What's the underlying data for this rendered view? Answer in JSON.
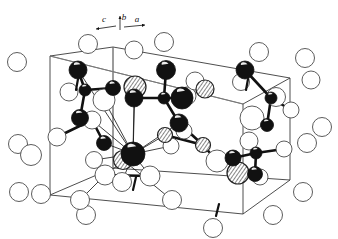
{
  "figure": {
    "kind": "crystal-structure-unit-cell-diagram",
    "title": "",
    "caption": "",
    "background_color": "#ffffff",
    "ink_color": "#111111"
  },
  "axis_indicator": {
    "name": "crystallographic-axes",
    "labels": [
      {
        "id": "c",
        "text": "c",
        "x": 104,
        "y": 22,
        "arrow_from": [
          116,
          26
        ],
        "arrow_to": [
          96,
          29
        ]
      },
      {
        "id": "b",
        "text": "b",
        "x": 124,
        "y": 20,
        "arrow_from": [
          120,
          30
        ],
        "arrow_to": [
          120,
          16
        ]
      },
      {
        "id": "a",
        "text": "a",
        "x": 137,
        "y": 22,
        "arrow_from": [
          124,
          27
        ],
        "arrow_to": [
          145,
          25
        ]
      }
    ],
    "origin": [
      120,
      29
    ]
  },
  "unit_cell_box": {
    "name": "unit-cell-outline",
    "stroke": "#3a3a3a",
    "stroke_width": 0.9,
    "vertices": {
      "front_bottom_left": [
        50,
        195
      ],
      "front_bottom_right": [
        243,
        214
      ],
      "front_top_right": [
        243,
        104
      ],
      "front_top_left": [
        50,
        56
      ],
      "back_bottom_left": [
        113,
        168
      ],
      "back_bottom_right": [
        290,
        180
      ],
      "back_top_right": [
        290,
        78
      ],
      "back_top_left": [
        113,
        47
      ]
    },
    "internal_guides": [
      {
        "from": [
          113,
          47
        ],
        "to": [
          113,
          168
        ]
      },
      {
        "from": [
          50,
          56
        ],
        "to": [
          243,
          104
        ]
      }
    ]
  },
  "legend_note": {
    "dark_sphere_label": "dark atom",
    "open_sphere_label": "open atom",
    "half_shaded_label": "shaded atom"
  },
  "chart_data": {
    "type": "scatter",
    "title": "",
    "xlabel": "",
    "ylabel": "",
    "note": "3D unit-cell packing diagram; spheres are atom positions projected to 2D, lines are bonds and cell edges.",
    "atom_styles": {
      "dark": {
        "fill": "#111111",
        "stroke": "#111111"
      },
      "open": {
        "fill": "#ffffff",
        "stroke": "#4a4a4a"
      },
      "shaded": {
        "fill": "#ffffff",
        "stroke": "#222222",
        "hatch": true
      }
    },
    "atoms": [
      {
        "id": "o1",
        "style": "open",
        "cx": 17,
        "cy": 62,
        "r": 9.5
      },
      {
        "id": "o2",
        "style": "open",
        "cx": 18,
        "cy": 144,
        "r": 9.5
      },
      {
        "id": "o3",
        "style": "open",
        "cx": 31,
        "cy": 155,
        "r": 10.5
      },
      {
        "id": "o4",
        "style": "open",
        "cx": 19,
        "cy": 192,
        "r": 9.5
      },
      {
        "id": "o5",
        "style": "open",
        "cx": 88,
        "cy": 44,
        "r": 9.5
      },
      {
        "id": "o6",
        "style": "open",
        "cx": 134,
        "cy": 50,
        "r": 9
      },
      {
        "id": "o7",
        "style": "open",
        "cx": 164,
        "cy": 42,
        "r": 9.5
      },
      {
        "id": "o8",
        "style": "open",
        "cx": 259,
        "cy": 52,
        "r": 9.5
      },
      {
        "id": "o9",
        "style": "open",
        "cx": 305,
        "cy": 58,
        "r": 9.5
      },
      {
        "id": "o10",
        "style": "open",
        "cx": 311,
        "cy": 80,
        "r": 9
      },
      {
        "id": "o11",
        "style": "open",
        "cx": 307,
        "cy": 143,
        "r": 9.5
      },
      {
        "id": "o12",
        "style": "open",
        "cx": 303,
        "cy": 192,
        "r": 9.5
      },
      {
        "id": "o13",
        "style": "open",
        "cx": 322,
        "cy": 127,
        "r": 9.5
      },
      {
        "id": "o14",
        "style": "open",
        "cx": 86,
        "cy": 215,
        "r": 9.5
      },
      {
        "id": "o15",
        "style": "open",
        "cx": 213,
        "cy": 228,
        "r": 9.5
      },
      {
        "id": "o16",
        "style": "open",
        "cx": 273,
        "cy": 215,
        "r": 9.5
      },
      {
        "id": "o17",
        "style": "open",
        "cx": 57,
        "cy": 137,
        "r": 9
      },
      {
        "id": "o18",
        "style": "open",
        "cx": 104,
        "cy": 100,
        "r": 11
      },
      {
        "id": "o19",
        "style": "open",
        "cx": 69,
        "cy": 92,
        "r": 9
      },
      {
        "id": "o20",
        "style": "open",
        "cx": 92,
        "cy": 120,
        "r": 9
      },
      {
        "id": "o21",
        "style": "open",
        "cx": 94,
        "cy": 160,
        "r": 8.5
      },
      {
        "id": "o22",
        "style": "open",
        "cx": 105,
        "cy": 175,
        "r": 10
      },
      {
        "id": "o23",
        "style": "open",
        "cx": 122,
        "cy": 182,
        "r": 9.5
      },
      {
        "id": "o24",
        "style": "open",
        "cx": 150,
        "cy": 176,
        "r": 10
      },
      {
        "id": "o25",
        "style": "open",
        "cx": 41,
        "cy": 194,
        "r": 9.5
      },
      {
        "id": "o26",
        "style": "open",
        "cx": 80,
        "cy": 200,
        "r": 9.5
      },
      {
        "id": "o27",
        "style": "open",
        "cx": 172,
        "cy": 200,
        "r": 9.5
      },
      {
        "id": "o28",
        "style": "open",
        "cx": 171,
        "cy": 146,
        "r": 8
      },
      {
        "id": "o29",
        "style": "open",
        "cx": 184,
        "cy": 131,
        "r": 8
      },
      {
        "id": "o30",
        "style": "open",
        "cx": 217,
        "cy": 161,
        "r": 11
      },
      {
        "id": "o31",
        "style": "open",
        "cx": 187,
        "cy": 96,
        "r": 9
      },
      {
        "id": "o32",
        "style": "open",
        "cx": 252,
        "cy": 118,
        "r": 12
      },
      {
        "id": "o33",
        "style": "open",
        "cx": 276,
        "cy": 97,
        "r": 9.5
      },
      {
        "id": "o34",
        "style": "open",
        "cx": 291,
        "cy": 110,
        "r": 8
      },
      {
        "id": "o35",
        "style": "open",
        "cx": 249,
        "cy": 141,
        "r": 9
      },
      {
        "id": "o36",
        "style": "open",
        "cx": 241,
        "cy": 82,
        "r": 8.5
      },
      {
        "id": "o37",
        "style": "open",
        "cx": 284,
        "cy": 149,
        "r": 8
      },
      {
        "id": "o38",
        "style": "open",
        "cx": 260,
        "cy": 177,
        "r": 8
      },
      {
        "id": "o39",
        "style": "open",
        "cx": 195,
        "cy": 81,
        "r": 9
      },
      {
        "id": "sh1",
        "style": "shaded",
        "cx": 135,
        "cy": 87,
        "r": 11
      },
      {
        "id": "sh2",
        "style": "shaded",
        "cx": 205,
        "cy": 89,
        "r": 9
      },
      {
        "id": "sh3",
        "style": "shaded",
        "cx": 165,
        "cy": 135,
        "r": 7.5
      },
      {
        "id": "sh4",
        "style": "shaded",
        "cx": 123,
        "cy": 160,
        "r": 9.5
      },
      {
        "id": "sh5",
        "style": "shaded",
        "cx": 203,
        "cy": 145,
        "r": 7.5
      },
      {
        "id": "sh6",
        "style": "shaded",
        "cx": 238,
        "cy": 173,
        "r": 11
      },
      {
        "id": "d1",
        "style": "dark",
        "cx": 78,
        "cy": 70,
        "r": 9
      },
      {
        "id": "d2",
        "style": "dark",
        "cx": 85,
        "cy": 90,
        "r": 6
      },
      {
        "id": "d3",
        "style": "dark",
        "cx": 113,
        "cy": 88,
        "r": 7.5
      },
      {
        "id": "d4",
        "style": "dark",
        "cx": 80,
        "cy": 118,
        "r": 8.5
      },
      {
        "id": "d5",
        "style": "dark",
        "cx": 134,
        "cy": 98,
        "r": 9
      },
      {
        "id": "d6",
        "style": "dark",
        "cx": 166,
        "cy": 70,
        "r": 9.5
      },
      {
        "id": "d7",
        "style": "dark",
        "cx": 164,
        "cy": 98,
        "r": 6
      },
      {
        "id": "d8",
        "style": "dark",
        "cx": 182,
        "cy": 98,
        "r": 11
      },
      {
        "id": "d9",
        "style": "dark",
        "cx": 179,
        "cy": 123,
        "r": 9
      },
      {
        "id": "d10",
        "style": "dark",
        "cx": 133,
        "cy": 154,
        "r": 12
      },
      {
        "id": "d11",
        "style": "dark",
        "cx": 245,
        "cy": 70,
        "r": 9
      },
      {
        "id": "d12",
        "style": "dark",
        "cx": 104,
        "cy": 143,
        "r": 7.5
      },
      {
        "id": "d13",
        "style": "dark",
        "cx": 233,
        "cy": 158,
        "r": 8
      },
      {
        "id": "d14",
        "style": "dark",
        "cx": 256,
        "cy": 153,
        "r": 6
      },
      {
        "id": "d15",
        "style": "dark",
        "cx": 255,
        "cy": 174,
        "r": 7.5
      },
      {
        "id": "d16",
        "style": "dark",
        "cx": 271,
        "cy": 98,
        "r": 6
      },
      {
        "id": "d17",
        "style": "dark",
        "cx": 267,
        "cy": 125,
        "r": 6.5
      }
    ],
    "bonds_solid": [
      {
        "from": "d1",
        "to": "d2"
      },
      {
        "from": "d2",
        "to": "d3"
      },
      {
        "from": "d2",
        "to": "d4"
      },
      {
        "from": "d6",
        "to": "d7"
      },
      {
        "from": "d7",
        "to": "d8"
      },
      {
        "from": "d7",
        "to": "d5"
      },
      {
        "from": "d7",
        "to": "d9"
      },
      {
        "from": "d9",
        "to": "sh5"
      },
      {
        "from": "sh5",
        "to": "sh3"
      },
      {
        "from": "sh5",
        "to": "o30"
      },
      {
        "from": "d11",
        "to": "d16"
      },
      {
        "from": "d16",
        "to": "o34"
      },
      {
        "from": "d16",
        "to": "o33"
      },
      {
        "from": "d16",
        "to": "d17"
      },
      {
        "from": "d13",
        "to": "d14"
      },
      {
        "from": "d14",
        "to": "d15"
      },
      {
        "from": "d14",
        "to": "o37"
      },
      {
        "from": "d14",
        "to": "o35"
      },
      {
        "from": "o17",
        "to": "o20"
      },
      {
        "from": "o20",
        "to": "d12"
      },
      {
        "from": "sh6",
        "to": "d13"
      },
      {
        "from": "o22",
        "to": "o24"
      }
    ],
    "bonds_thin": [
      {
        "from": "d10",
        "to": "d1"
      },
      {
        "from": "d10",
        "to": "sh1"
      },
      {
        "from": "d10",
        "to": "d5"
      },
      {
        "from": "d10",
        "to": "d9"
      },
      {
        "from": "d10",
        "to": "o18"
      },
      {
        "from": "d10",
        "to": "o21"
      },
      {
        "from": "d10",
        "to": "o22"
      },
      {
        "from": "d10",
        "to": "o23"
      },
      {
        "from": "d10",
        "to": "sh4"
      },
      {
        "from": "d10",
        "to": "o20"
      },
      {
        "from": "d10",
        "to": "sh3"
      },
      {
        "from": "d10",
        "to": "o28"
      },
      {
        "from": "d10",
        "to": "d12"
      },
      {
        "from": "d10",
        "to": "o24"
      },
      {
        "from": "sh4",
        "to": "o27"
      },
      {
        "from": "o22",
        "to": "o26"
      }
    ],
    "tick_marks": [
      {
        "from": [
          136,
          177
        ],
        "to": [
          133,
          190
        ]
      },
      {
        "from": [
          219,
          204
        ],
        "to": [
          216,
          216
        ]
      },
      {
        "from": [
          78,
          79
        ],
        "to": [
          76,
          90
        ]
      },
      {
        "from": [
          248,
          79
        ],
        "to": [
          246,
          90
        ]
      }
    ]
  }
}
